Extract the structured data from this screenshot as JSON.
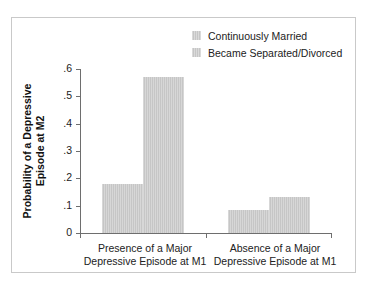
{
  "chart_data": {
    "type": "bar",
    "title": "",
    "xlabel": "",
    "ylabel": "Probability of a Depressive Episode at M2",
    "ylabel_lines": [
      "Probability of a Depressive",
      "Episode at M2"
    ],
    "ylim": [
      0,
      0.6
    ],
    "yticks": [
      0.6,
      0.5,
      0.4,
      0.3,
      0.2,
      0.1,
      0
    ],
    "ytick_labels": [
      ".6",
      ".5",
      ".4",
      ".3",
      ".2",
      ".1",
      "0"
    ],
    "grid": false,
    "legend_position": "top-right",
    "categories": [
      "Presence of a Major Depressive Episode at M1",
      "Absence of a Major Depressive Episode at M1"
    ],
    "category_lines": [
      [
        "Presence of a Major",
        "Depressive Episode at M1"
      ],
      [
        "Absence of a Major",
        "Depressive Episode at M1"
      ]
    ],
    "series": [
      {
        "name": "Continuously Married",
        "values": [
          0.18,
          0.085
        ],
        "color": "#c6c6c6"
      },
      {
        "name": "Became Separated/Divorced",
        "values": [
          0.57,
          0.13
        ],
        "color": "#c6c6c6"
      }
    ]
  },
  "legend": {
    "items": [
      {
        "label": "Continuously Married"
      },
      {
        "label": "Became Separated/Divorced"
      }
    ]
  },
  "colors": {
    "bar_fill": "#c6c6c6",
    "axis": "#6e6e6e",
    "frame": "#c9c9c9",
    "background": "#ffffff",
    "text": "#222222"
  }
}
